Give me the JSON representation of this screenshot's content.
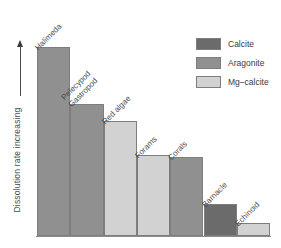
{
  "chart_data": {
    "type": "bar",
    "title": "",
    "xlabel": "",
    "ylabel": "Dissolution rate increasing",
    "grid": false,
    "legend_position": "top-right",
    "axis_note": "y axis qualitative, arrow indicates increasing dissolution rate; no numeric ticks",
    "categories": [
      "Halimeda",
      "Pelecypod\nGastropod",
      "Red algae",
      "Forams",
      "Corals",
      "Barnacle",
      "Echinoid"
    ],
    "values": [
      100,
      70,
      61,
      43,
      42,
      17,
      7
    ],
    "bar_minerals": [
      "Aragonite",
      "Aragonite",
      "Mg-calcite",
      "Mg-calcite",
      "Aragonite",
      "Calcite",
      "Mg-calcite"
    ],
    "series": [
      {
        "name": "Dissolution rate",
        "values": [
          100,
          70,
          61,
          43,
          42,
          17,
          7
        ]
      }
    ],
    "ylim": [
      0,
      105
    ]
  },
  "yaxis": {
    "label": "Dissolution rate increasing",
    "arrow_icon": "up-arrow-icon"
  },
  "bars": [
    {
      "label_line1": "Halimeda",
      "label_line2": "",
      "mineral": "Aragonite",
      "value": 100
    },
    {
      "label_line1": "Pelecypod",
      "label_line2": "Gastropod",
      "mineral": "Aragonite",
      "value": 70
    },
    {
      "label_line1": "Red algae",
      "label_line2": "",
      "mineral": "Mg-calcite",
      "value": 61
    },
    {
      "label_line1": "Forams",
      "label_line2": "",
      "mineral": "Mg-calcite",
      "value": 43
    },
    {
      "label_line1": "Corals",
      "label_line2": "",
      "mineral": "Aragonite",
      "value": 42
    },
    {
      "label_line1": "Barnacle",
      "label_line2": "",
      "mineral": "Calcite",
      "value": 17
    },
    {
      "label_line1": "Echinoid",
      "label_line2": "",
      "mineral": "Mg-calcite",
      "value": 7
    }
  ],
  "legend": {
    "items": [
      {
        "label": "Calcite",
        "color": "#6b6b6b"
      },
      {
        "label": "Aragonite",
        "color": "#909090"
      },
      {
        "label": "Mg–calcite",
        "color": "#d2d2d2"
      }
    ]
  },
  "colors": {
    "calcite": "#6b6b6b",
    "aragonite": "#909090",
    "mg_calcite": "#d2d2d2",
    "background": "#ffffff",
    "text": "#3a3a3a",
    "bar_border": "#7d7d7d"
  }
}
